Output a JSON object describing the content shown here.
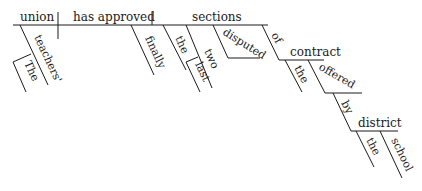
{
  "diagram": {
    "type": "sentence-diagram",
    "sentence_parts": {
      "subject": "union",
      "verb": "has approved",
      "object": "sections",
      "subject_modifiers": [
        "teachers'",
        "The"
      ],
      "verb_modifiers": [
        "finally"
      ],
      "object_modifiers": [
        "the",
        "two",
        "last",
        "disputed"
      ],
      "preposition_1": "of",
      "prep_1_object": "contract",
      "prep_1_object_modifiers": [
        "the",
        "offered"
      ],
      "preposition_2": "by",
      "prep_2_object": "district",
      "prep_2_object_modifiers": [
        "the",
        "school"
      ]
    }
  }
}
